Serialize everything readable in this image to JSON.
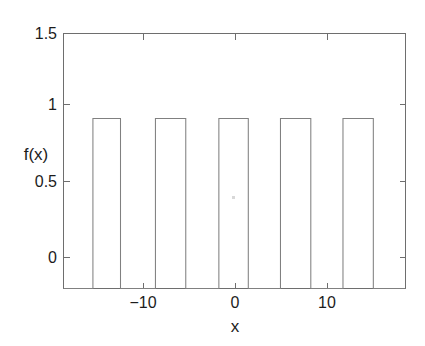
{
  "chart_data": {
    "type": "line",
    "title": "",
    "subtitle": "",
    "xlabel": "x",
    "ylabel": "f(x)",
    "xlim": [
      -18.7,
      18.5
    ],
    "ylim": [
      0,
      1.5
    ],
    "xticks": [
      -10,
      0,
      10
    ],
    "xtick_labels": [
      "−10",
      "0",
      "10"
    ],
    "yticks": [
      0,
      0.5,
      1,
      1.5
    ],
    "ytick_labels": [
      "0",
      "0.5",
      "1",
      "1.5"
    ],
    "grid": false,
    "legend": null,
    "line_color": "#808080",
    "axis_color": "#6e6e6e",
    "background": "#ffffff",
    "pulse_amplitude": 1,
    "baseline_value": 0,
    "pulse_width": 3.2,
    "pulse_period": 6.8,
    "pulse_count": 5,
    "pulses": [
      {
        "start": -15.5,
        "end": -12.5,
        "value": 1
      },
      {
        "start": -8.7,
        "end": -5.4,
        "value": 1
      },
      {
        "start": -1.8,
        "end": 1.4,
        "value": 1
      },
      {
        "start": 4.9,
        "end": 8.2,
        "value": 1
      },
      {
        "start": 11.7,
        "end": 15.0,
        "value": 1
      }
    ],
    "x": [
      -18.7,
      -15.5,
      -15.5,
      -12.5,
      -12.5,
      -8.7,
      -8.7,
      -5.4,
      -5.4,
      -1.8,
      -1.8,
      1.4,
      1.4,
      4.9,
      4.9,
      8.2,
      8.2,
      11.7,
      11.7,
      15.0,
      15.0,
      18.5
    ],
    "y": [
      0,
      0,
      1,
      1,
      0,
      0,
      1,
      1,
      0,
      0,
      1,
      1,
      0,
      0,
      1,
      1,
      0,
      0,
      1,
      1,
      0,
      0
    ]
  },
  "axes": {
    "y_label": "f(x)",
    "x_label": "x"
  }
}
